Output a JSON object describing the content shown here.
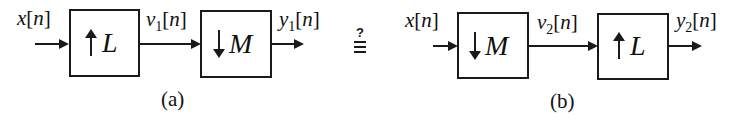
{
  "diagram_a": {
    "input_label": {
      "name": "x",
      "index": "n"
    },
    "block1": {
      "direction": "up",
      "factor": "L",
      "operation": "upsampler"
    },
    "mid_label": {
      "name": "v",
      "sub": "1",
      "index": "n"
    },
    "block2": {
      "direction": "down",
      "factor": "M",
      "operation": "downsampler"
    },
    "output_label": {
      "name": "y",
      "sub": "1",
      "index": "n"
    },
    "caption": "(a)"
  },
  "equivalence": {
    "question": "?",
    "symbol": "≡"
  },
  "diagram_b": {
    "input_label": {
      "name": "x",
      "index": "n"
    },
    "block1": {
      "direction": "down",
      "factor": "M",
      "operation": "downsampler"
    },
    "mid_label": {
      "name": "v",
      "sub": "2",
      "index": "n"
    },
    "block2": {
      "direction": "up",
      "factor": "L",
      "operation": "upsampler"
    },
    "output_label": {
      "name": "y",
      "sub": "2",
      "index": "n"
    },
    "caption": "(b)"
  },
  "colors": {
    "stroke": "#1a1a1a",
    "background": "#ffffff"
  }
}
